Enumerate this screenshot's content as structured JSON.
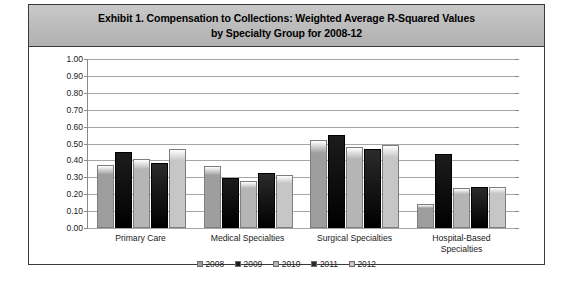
{
  "exhibit": {
    "title": "Exhibit 1. Compensation to Collections: Weighted Average R-Squared Values\nby Specialty Group for 2008-12"
  },
  "chart_data": {
    "type": "bar",
    "title": "Exhibit 1. Compensation to Collections: Weighted Average R-Squared Values by Specialty Group for 2008-12",
    "xlabel": "",
    "ylabel": "",
    "ylim": [
      0.0,
      1.0
    ],
    "ytick_labels": [
      "1.00",
      "0.90",
      "0.80",
      "0.70",
      "0.60",
      "0.50",
      "0.40",
      "0.30",
      "0.20",
      "0.10",
      "0.00"
    ],
    "ytick_values": [
      1.0,
      0.9,
      0.8,
      0.7,
      0.6,
      0.5,
      0.4,
      0.3,
      0.2,
      0.1,
      0.0
    ],
    "grid": true,
    "legend_position": "bottom",
    "categories": [
      "Primary Care",
      "Medical Specialties",
      "Surgical Specialties",
      "Hospital-Based\nSpecialties"
    ],
    "series": [
      {
        "name": "2008",
        "color": "#9e9e9e",
        "values": [
          0.37,
          0.365,
          0.52,
          0.14
        ]
      },
      {
        "name": "2009",
        "color": "#1c1c1c",
        "values": [
          0.45,
          0.295,
          0.55,
          0.44
        ]
      },
      {
        "name": "2010",
        "color": "#b5b5b5",
        "values": [
          0.41,
          0.28,
          0.48,
          0.235
        ]
      },
      {
        "name": "2011",
        "color": "#2b2b2b",
        "values": [
          0.385,
          0.325,
          0.47,
          0.24
        ]
      },
      {
        "name": "2012",
        "color": "#c6c6c6",
        "values": [
          0.465,
          0.315,
          0.49,
          0.24
        ]
      }
    ]
  }
}
